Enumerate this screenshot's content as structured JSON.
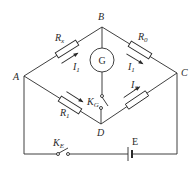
{
  "diagram": {
    "nodes": [
      {
        "id": "A",
        "label": "A"
      },
      {
        "id": "B",
        "label": "B"
      },
      {
        "id": "C",
        "label": "C"
      },
      {
        "id": "D",
        "label": "D"
      }
    ],
    "components": {
      "rx": {
        "label": "R",
        "sub": "x",
        "between": "A-B"
      },
      "r0": {
        "label": "R",
        "sub": "0",
        "between": "B-C"
      },
      "r1": {
        "label": "R",
        "sub": "1",
        "between": "A-D"
      },
      "r2": {
        "label": "",
        "sub": "",
        "between": "D-C"
      },
      "galvanometer": {
        "label": "G",
        "between": "B-D"
      },
      "switch_g": {
        "label": "K",
        "sub": "G"
      },
      "switch_e": {
        "label": "K",
        "sub": "E"
      },
      "battery": {
        "label": "E"
      }
    },
    "currents": {
      "i1_ab": {
        "label": "I",
        "sub": "1"
      },
      "i1_bc": {
        "label": "I",
        "sub": "1"
      },
      "i2_dc": {
        "label": "I",
        "sub": "2"
      }
    },
    "colors": {
      "line": "#2a2a2a",
      "background": "#ffffff"
    }
  }
}
